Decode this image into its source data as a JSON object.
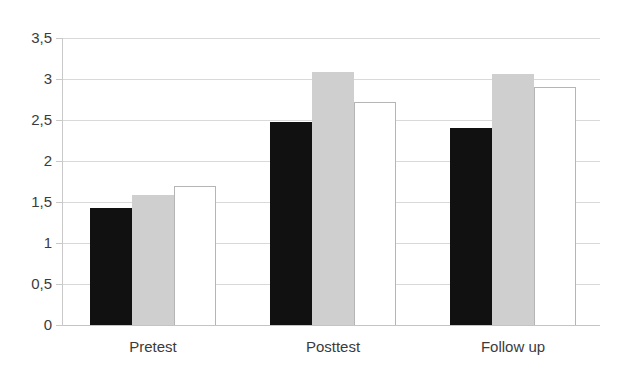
{
  "chart_data": {
    "type": "bar",
    "title": "",
    "subtitle": "",
    "xlabel": "",
    "ylabel": "",
    "categories": [
      "Pretest",
      "Posttest",
      "Follow up"
    ],
    "series": [
      {
        "name": "series-1-black",
        "color": "#111111",
        "values": [
          1.43,
          2.47,
          2.4
        ]
      },
      {
        "name": "series-2-gray",
        "color": "#cfcfcf",
        "values": [
          1.58,
          3.09,
          3.06
        ]
      },
      {
        "name": "series-3-white",
        "color": "#ffffff",
        "values": [
          1.7,
          2.72,
          2.9
        ]
      }
    ],
    "ylim": [
      0,
      3.5
    ],
    "ytick_values": [
      0,
      0.5,
      1,
      1.5,
      2,
      2.5,
      3,
      3.5
    ],
    "ytick_labels": [
      "0",
      "0,5",
      "1",
      "1,5",
      "2",
      "2,5",
      "3",
      "3,5"
    ],
    "decimal_separator": ",",
    "grid": true,
    "grid_axis": "y",
    "grid_color": "#d9d9d9",
    "legend": false,
    "legend_position": "none",
    "background_color": "#ffffff",
    "axis_color": "#c9c9c9",
    "tick_label_color": "#3b3b3b",
    "bar_group_gap": true,
    "annotations": []
  },
  "axis": {
    "y": {
      "ticks": [
        {
          "value": 3.5,
          "label": "3,5"
        },
        {
          "value": 3,
          "label": "3"
        },
        {
          "value": 2.5,
          "label": "2,5"
        },
        {
          "value": 2,
          "label": "2"
        },
        {
          "value": 1.5,
          "label": "1,5"
        },
        {
          "value": 1,
          "label": "1"
        },
        {
          "value": 0.5,
          "label": "0,5"
        },
        {
          "value": 0,
          "label": "0"
        }
      ]
    },
    "x": {
      "ticks": [
        {
          "label": "Pretest"
        },
        {
          "label": "Posttest"
        },
        {
          "label": "Follow up"
        }
      ]
    }
  }
}
